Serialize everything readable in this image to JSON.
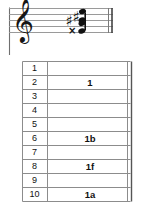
{
  "notation": {
    "clef": "treble-clef",
    "staff_lines": 5,
    "barline_left": "thin-barline",
    "barline_right": "double-barline",
    "chord": {
      "name": "chord-cluster",
      "notes": [
        {
          "id": "note-top",
          "accidental": "none",
          "accidental_glyph": ""
        },
        {
          "id": "note-upper",
          "accidental": "sharp",
          "accidental_glyph": "♯"
        },
        {
          "id": "note-middle",
          "accidental": "sharp",
          "accidental_glyph": "♯"
        },
        {
          "id": "note-lower",
          "accidental": "double-sharp",
          "accidental_glyph": "×"
        }
      ]
    }
  },
  "table": {
    "rows": [
      {
        "number": "1",
        "value": ""
      },
      {
        "number": "2",
        "value": "1"
      },
      {
        "number": "3",
        "value": ""
      },
      {
        "number": "4",
        "value": ""
      },
      {
        "number": "5",
        "value": ""
      },
      {
        "number": "6",
        "value": "1b"
      },
      {
        "number": "7",
        "value": ""
      },
      {
        "number": "8",
        "value": "1f"
      },
      {
        "number": "9",
        "value": ""
      },
      {
        "number": "10",
        "value": "1a"
      }
    ]
  },
  "colors": {
    "ink": "#111111",
    "rule": "#8c8c8c",
    "background": "#ffffff"
  }
}
